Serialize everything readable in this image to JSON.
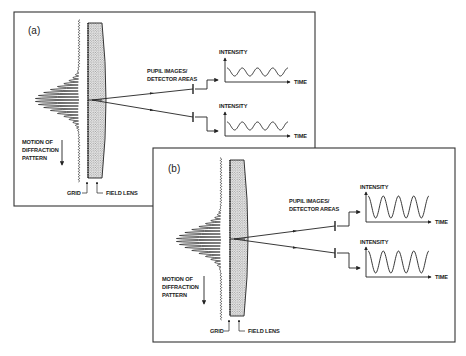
{
  "figure": {
    "panels": [
      {
        "id": "a",
        "tag": "(a)",
        "pupil_label_1": "PUPIL IMAGES/",
        "pupil_label_2": "DETECTOR AREAS",
        "graphs": [
          {
            "ylabel": "INTENSITY",
            "xlabel": "TIME",
            "cycles": 4,
            "amplitude": "small"
          },
          {
            "ylabel": "INTENSITY",
            "xlabel": "TIME",
            "cycles": 4,
            "amplitude": "small"
          }
        ],
        "motion_label": [
          "MOTION OF",
          "DIFFRACTION",
          "PATTERN"
        ],
        "grid_label": "GRID",
        "lens_label": "FIELD LENS"
      },
      {
        "id": "b",
        "tag": "(b)",
        "pupil_label_1": "PUPIL IMAGES/",
        "pupil_label_2": "DETECTOR AREAS",
        "graphs": [
          {
            "ylabel": "INTENSITY",
            "xlabel": "TIME",
            "cycles": 4,
            "amplitude": "large"
          },
          {
            "ylabel": "INTENSITY",
            "xlabel": "TIME",
            "cycles": 4,
            "amplitude": "large"
          }
        ],
        "motion_label": [
          "MOTION OF",
          "DIFFRACTION",
          "PATTERN"
        ],
        "grid_label": "GRID",
        "lens_label": "FIELD LENS"
      }
    ]
  }
}
